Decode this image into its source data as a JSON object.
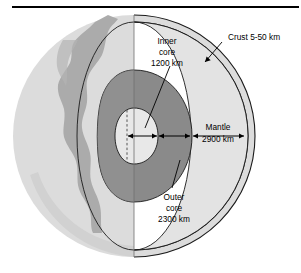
{
  "figure": {
    "title_rule": ""
  },
  "labels": {
    "crust": "Crust 5-50 km",
    "inner_core_l1": "Inner",
    "inner_core_l2": "core",
    "inner_core_l3": "1200 km",
    "outer_core_l1": "Outer",
    "outer_core_l2": "core",
    "outer_core_l3": "2300 km",
    "mantle_l1": "Mantle",
    "mantle_l2": "2900 km"
  },
  "layers": [
    {
      "name": "crust",
      "thickness": "5-50 km"
    },
    {
      "name": "mantle",
      "thickness": "2900 km"
    },
    {
      "name": "outer core",
      "thickness": "2300 km"
    },
    {
      "name": "inner core",
      "thickness": "1200 km"
    }
  ],
  "colors": {
    "sphere_surface": "#dcdcdc",
    "sphere_shade": "#d0d0d0",
    "continent": "#a8a8a8",
    "mantle_face": "#e3e3e3",
    "outer_core": "#8a8a8a",
    "inner_core": "#e8e8e8",
    "outline": "#1a1a1a",
    "rule": "#000000",
    "background": "#ffffff"
  }
}
